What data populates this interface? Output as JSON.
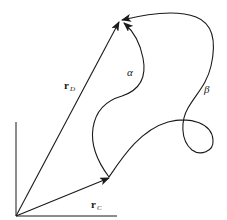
{
  "diagram": {
    "stroke_color": "#1a1a1a",
    "background": "#ffffff",
    "origin": {
      "x": 16,
      "y": 216
    },
    "points": {
      "C": {
        "x": 109,
        "y": 178
      },
      "D": {
        "x": 120,
        "y": 20
      }
    },
    "axes": {
      "vertical": {
        "x1": 16,
        "y1": 216,
        "x2": 16,
        "y2": 122
      },
      "horizontal": {
        "x1": 16,
        "y1": 216,
        "x2": 117,
        "y2": 216
      }
    },
    "labels": {
      "r_D": {
        "main": "r",
        "sub": "D"
      },
      "r_C": {
        "main": "r",
        "sub": "C"
      },
      "alpha": "α",
      "beta": "β"
    }
  }
}
